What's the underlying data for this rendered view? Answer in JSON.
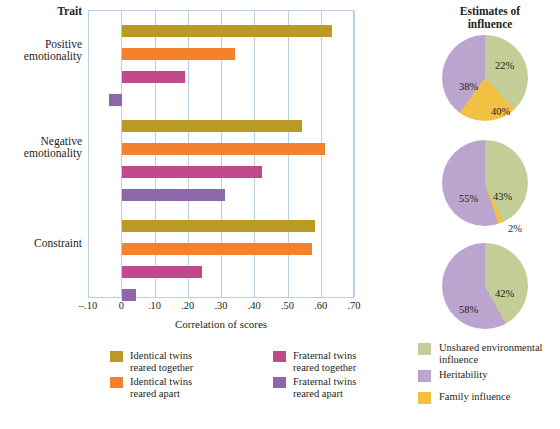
{
  "chart_data": [
    {
      "type": "bar",
      "title": "",
      "xlabel": "Correlation of scores",
      "ylabel": "Trait",
      "orientation": "horizontal",
      "xlim": [
        -0.1,
        0.7
      ],
      "grid": true,
      "tick_labels": [
        "–.10",
        "0",
        ".10",
        ".20",
        ".30",
        ".40",
        ".50",
        ".60",
        ".70"
      ],
      "tick_values": [
        -0.1,
        0,
        0.1,
        0.2,
        0.3,
        0.4,
        0.5,
        0.6,
        0.7
      ],
      "categories": [
        "Positive emotionality",
        "Negative emotionality",
        "Constraint"
      ],
      "series": [
        {
          "name": "Identical twins reared together",
          "color": "#b99a22",
          "values": [
            0.63,
            0.54,
            0.58
          ]
        },
        {
          "name": "Identical twins reared apart",
          "color": "#f4812c",
          "values": [
            0.34,
            0.61,
            0.57
          ]
        },
        {
          "name": "Fraternal twins reared together",
          "color": "#c0488b",
          "values": [
            0.19,
            0.42,
            0.24
          ]
        },
        {
          "name": "Fraternal twins reared apart",
          "color": "#8e66aa",
          "values": [
            -0.04,
            0.31,
            0.04
          ]
        }
      ],
      "legend_position": "bottom"
    },
    {
      "type": "pie",
      "title": "Estimates of influence",
      "subtitle": "Positive emotionality",
      "labels": [
        "Unshared environmental influence",
        "Family influence",
        "Heritability"
      ],
      "values": [
        38,
        22,
        40
      ],
      "display_labels": [
        "38%",
        "22%",
        "40%"
      ],
      "colors": [
        "#c3ce96",
        "#f2c141",
        "#bba4ce"
      ]
    },
    {
      "type": "pie",
      "title": "",
      "subtitle": "Negative emotionality",
      "labels": [
        "Heritability",
        "Unshared environmental influence",
        "Family influence"
      ],
      "values": [
        55,
        43,
        2
      ],
      "display_labels": [
        "55%",
        "43%",
        "2%"
      ],
      "colors": [
        "#bba4ce",
        "#c3ce96",
        "#f2c141"
      ]
    },
    {
      "type": "pie",
      "title": "",
      "subtitle": "Constraint",
      "labels": [
        "Heritability",
        "Unshared environmental influence"
      ],
      "values": [
        58,
        42
      ],
      "display_labels": [
        "58%",
        "42%"
      ],
      "colors": [
        "#bba4ce",
        "#c3ce96"
      ]
    }
  ],
  "bar_chart": {
    "trait_header": "Trait",
    "traits": [
      {
        "line1": "Positive",
        "line2": "emotionality"
      },
      {
        "line1": "Negative",
        "line2": "emotionality"
      },
      {
        "line1": "Constraint",
        "line2": ""
      }
    ],
    "xaxis_title": "Correlation of scores",
    "ticks": [
      {
        "label": "–.10"
      },
      {
        "label": "0"
      },
      {
        "label": ".10"
      },
      {
        "label": ".20"
      },
      {
        "label": ".30"
      },
      {
        "label": ".40"
      },
      {
        "label": ".50"
      },
      {
        "label": ".60"
      },
      {
        "label": ".70"
      }
    ],
    "legend": [
      {
        "line1": "Identical twins",
        "line2": "reared together",
        "color": "#b99a22"
      },
      {
        "line1": "Identical twins",
        "line2": "reared apart",
        "color": "#f4812c"
      },
      {
        "line1": "Fraternal twins",
        "line2": "reared together",
        "color": "#c0488b"
      },
      {
        "line1": "Fraternal twins",
        "line2": "reared apart",
        "color": "#8e66aa"
      }
    ]
  },
  "pie_panel": {
    "title_line1": "Estimates of",
    "title_line2": "influence",
    "pies": [
      {
        "slices": [
          {
            "label": "38%",
            "value": 38,
            "color": "#c3ce96"
          },
          {
            "label": "22%",
            "value": 22,
            "color": "#f2c141"
          },
          {
            "label": "40%",
            "value": 40,
            "color": "#bba4ce"
          }
        ]
      },
      {
        "slices": [
          {
            "label": "43%",
            "value": 43,
            "color": "#c3ce96"
          },
          {
            "label": "2%",
            "value": 2,
            "color": "#f2c141"
          },
          {
            "label": "55%",
            "value": 55,
            "color": "#bba4ce"
          }
        ]
      },
      {
        "slices": [
          {
            "label": "42%",
            "value": 42,
            "color": "#c3ce96"
          },
          {
            "label": "58%",
            "value": 58,
            "color": "#bba4ce"
          }
        ]
      }
    ],
    "legend": [
      {
        "line1": "Unshared environmental",
        "line2": "influence",
        "color": "#c3ce96"
      },
      {
        "line1": "Heritability",
        "line2": "",
        "color": "#bba4ce"
      },
      {
        "line1": "Family influence",
        "line2": "",
        "color": "#f2c141"
      }
    ]
  },
  "colors": {
    "identical_together": "#b99a22",
    "identical_apart": "#f4812c",
    "fraternal_together": "#c0488b",
    "fraternal_apart": "#8e66aa",
    "unshared_env": "#c3ce96",
    "heritability": "#bba4ce",
    "family": "#f2c141",
    "gridline": "#b9cfe4"
  }
}
